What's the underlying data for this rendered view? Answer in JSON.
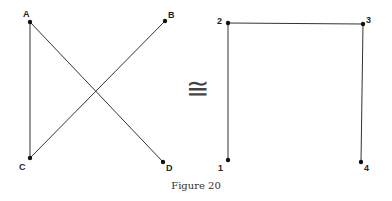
{
  "caption": "Figure 20",
  "relation_symbol": "≅",
  "left_graph": {
    "vertices": [
      {
        "label": "A",
        "x": 30,
        "y": 22
      },
      {
        "label": "B",
        "x": 165,
        "y": 21
      },
      {
        "label": "C",
        "x": 30,
        "y": 158
      },
      {
        "label": "D",
        "x": 163,
        "y": 162
      }
    ],
    "edges": [
      [
        "A",
        "C"
      ],
      [
        "A",
        "D"
      ],
      [
        "C",
        "B"
      ]
    ]
  },
  "right_graph": {
    "vertices": [
      {
        "label": "1",
        "x": 228,
        "y": 160
      },
      {
        "label": "2",
        "x": 228,
        "y": 23
      },
      {
        "label": "3",
        "x": 363,
        "y": 24
      },
      {
        "label": "4",
        "x": 361,
        "y": 162
      }
    ],
    "edges": [
      [
        "1",
        "2"
      ],
      [
        "2",
        "3"
      ],
      [
        "3",
        "4"
      ]
    ]
  }
}
